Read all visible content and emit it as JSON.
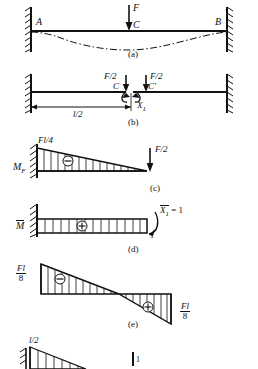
{
  "figure": {
    "type": "structural-beam-diagram"
  },
  "panels": [
    {
      "id": "a",
      "caption": "(a)",
      "description": "Fixed-fixed beam AB with central point load F at C and dash-dot deflected shape",
      "labels": {
        "left_support": "A",
        "right_support": "B",
        "load": "F",
        "midpoint": "C"
      }
    },
    {
      "id": "b",
      "caption": "(b)",
      "description": "Primary system: beam cut at midspan, F/2 applied on each side, redundant moment X1",
      "labels": {
        "load_left": "F/2",
        "load_right": "F/2",
        "cut_left": "C",
        "cut_right": "C'",
        "redundant": "X",
        "redundant_sub": "1",
        "dimension": "l/2"
      }
    },
    {
      "id": "c",
      "caption": "(c)",
      "description": "Bending moment diagram MF due to external load: triangle, negative, peak Fl/4 at wall",
      "labels": {
        "diagram_name": "M",
        "diagram_sub": "F",
        "peak": "Fl/4",
        "tip_load": "F/2",
        "sign": "−"
      }
    },
    {
      "id": "d",
      "caption": "(d)",
      "description": "Unit bending moment diagram M-bar due to redundant X1 = 1: uniform rectangle, positive",
      "labels": {
        "diagram_name": "M",
        "unit_redundant": "X",
        "unit_redundant_sub": "1",
        "unit_equals": "= 1",
        "ordinate": "1",
        "sign": "+"
      }
    },
    {
      "id": "e",
      "caption": "(e)",
      "description": "Final bending moment diagram: Fl/8 negative at wall, Fl/8 positive at midspan",
      "labels": {
        "left_value_num": "Fl",
        "left_value_den": "8",
        "right_value_num": "Fl",
        "right_value_den": "8",
        "sign_left": "−",
        "sign_right": "+"
      }
    },
    {
      "id": "f",
      "caption": "",
      "description": "Partial next figure at bottom edge: triangular diagram labelled l/2 and unit ordinate 1",
      "labels": {
        "span": "l/2",
        "unit": "1"
      }
    }
  ],
  "colors": {
    "ink": "#111111",
    "background": "#ffffff"
  }
}
